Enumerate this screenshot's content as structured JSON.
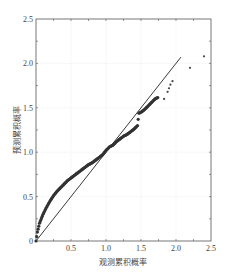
{
  "chart_data": {
    "type": "scatter",
    "title": "",
    "xlabel": "观测累积概率",
    "ylabel": "预测累积概率",
    "xlim": [
      0,
      2.5
    ],
    "ylim": [
      0,
      2.5
    ],
    "xticks": [
      "0.5",
      "1.0",
      "1.5",
      "2.0",
      "2.5"
    ],
    "yticks": [
      "0",
      "0.5",
      "1.0",
      "1.5",
      "2.0",
      "2.5"
    ],
    "grid": true,
    "legend": null,
    "series": [
      {
        "name": "reference-line",
        "kind": "line",
        "x": [
          0,
          2.07
        ],
        "y": [
          0,
          2.07
        ]
      },
      {
        "name": "quantile-points",
        "kind": "scatter",
        "x": [
          0.0,
          0.02,
          0.05,
          0.1,
          0.15,
          0.2,
          0.25,
          0.3,
          0.35,
          0.4,
          0.45,
          0.5,
          0.55,
          0.6,
          0.65,
          0.7,
          0.75,
          0.8,
          0.85,
          0.9,
          0.95,
          1.0,
          1.05,
          1.1,
          1.15,
          1.2,
          1.25,
          1.3,
          1.35,
          1.4,
          1.45,
          1.47,
          1.5,
          1.55,
          1.6,
          1.65,
          1.7,
          1.75,
          1.83,
          1.88,
          1.9,
          1.92,
          1.95,
          2.2,
          2.4
        ],
        "y": [
          0.0,
          0.1,
          0.2,
          0.3,
          0.38,
          0.45,
          0.51,
          0.56,
          0.6,
          0.64,
          0.68,
          0.71,
          0.74,
          0.77,
          0.8,
          0.83,
          0.86,
          0.88,
          0.91,
          0.94,
          0.97,
          1.02,
          1.06,
          1.08,
          1.12,
          1.15,
          1.18,
          1.2,
          1.23,
          1.26,
          1.3,
          1.44,
          1.45,
          1.48,
          1.52,
          1.56,
          1.6,
          1.62,
          1.6,
          1.68,
          1.72,
          1.76,
          1.8,
          1.95,
          2.08
        ]
      }
    ]
  }
}
